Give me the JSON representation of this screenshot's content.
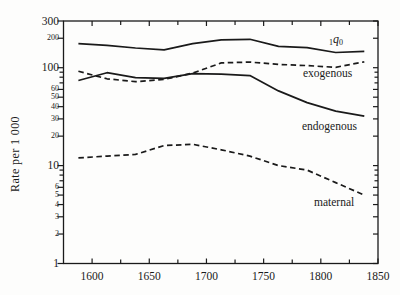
{
  "figure": {
    "background": "#fdfdfc",
    "ink_color": "#1a1a1a"
  },
  "chart_data": {
    "type": "line",
    "title": "",
    "xlabel": "",
    "ylabel": "Rate per 1 000",
    "grid": false,
    "legend_position": "inline-labels",
    "x_axis": {
      "range": [
        1575,
        1850
      ],
      "major_ticks": [
        1600,
        1650,
        1700,
        1750,
        1800,
        1850
      ],
      "minor_ticks": [
        1625,
        1675,
        1725,
        1775,
        1825
      ]
    },
    "y_axis": {
      "scale": "log",
      "range": [
        1,
        300
      ],
      "labeled_ticks": [
        300,
        200,
        100,
        60,
        50,
        40,
        30,
        20,
        10,
        6,
        5,
        4,
        3,
        2,
        1
      ],
      "big_labels": [
        300,
        100,
        10,
        1
      ],
      "minor_ticks": [
        90,
        80,
        70,
        9,
        8,
        7
      ]
    },
    "x": [
      1588,
      1613,
      1638,
      1663,
      1688,
      1713,
      1738,
      1763,
      1788,
      1813,
      1838
    ],
    "series": [
      {
        "name": "1q0",
        "label_parts": {
          "pre_sub": "1",
          "base": "q",
          "post_sub": "0"
        },
        "line": "solid",
        "values": [
          176,
          169,
          159,
          152,
          176,
          193,
          195,
          165,
          160,
          143,
          147
        ]
      },
      {
        "name": "exogenous",
        "label": "exogenous",
        "line": "dashed",
        "values": [
          92,
          77,
          72,
          76,
          88,
          112,
          114,
          108,
          105,
          101,
          115
        ]
      },
      {
        "name": "endogenous",
        "label": "endogenous",
        "line": "solid",
        "values": [
          74,
          89,
          79,
          78,
          87,
          86,
          83,
          58,
          44,
          36,
          32
        ]
      },
      {
        "name": "maternal",
        "label": "maternal",
        "line": "dashed",
        "values": [
          12,
          12.5,
          13,
          16,
          16.5,
          14.5,
          12.5,
          10,
          9,
          6.7,
          5
        ]
      }
    ]
  }
}
